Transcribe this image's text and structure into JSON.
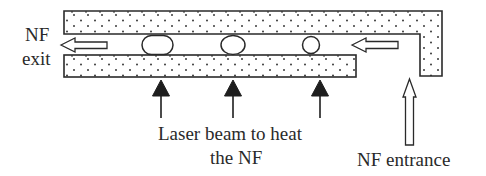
{
  "diagram": {
    "type": "nanofluid channel schematic",
    "colors": {
      "stroke": "#2a2a2a",
      "fill": "#ffffff",
      "dots": "#3a3a3a",
      "laser_arrow": "#1e1e1e"
    },
    "labels": {
      "exit_line1": "NF",
      "exit_line2": "exit",
      "laser_line1": "Laser beam to heat",
      "laser_line2": "the NF",
      "entrance": "NF entrance"
    },
    "components": {
      "top_wall": "L-shaped porous wall (dotted)",
      "bottom_wall": "porous wall (dotted)",
      "bubbles": [
        "large elongated bubble",
        "medium bubble",
        "small bubble"
      ],
      "flow_arrows": [
        "exit flow arrow (left)",
        "inlet flow arrow (left)",
        "entrance arrow (up)"
      ],
      "laser_arrows": 3
    }
  }
}
